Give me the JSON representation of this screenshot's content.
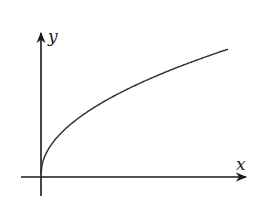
{
  "chart_data": {
    "type": "line",
    "title": "",
    "xlabel": "x",
    "ylabel": "y",
    "grid": false,
    "legend": null,
    "function_shape": "y = sqrt(x)",
    "x": [
      0,
      0.02,
      0.1,
      0.25,
      0.5,
      0.75,
      1.0
    ],
    "series": [
      {
        "name": "curve",
        "values": [
          0.02,
          0.16,
          0.33,
          0.5,
          0.71,
          0.87,
          1.0
        ]
      }
    ],
    "xlim": [
      0,
      1.1
    ],
    "ylim": [
      0,
      1.1
    ],
    "ticks": []
  },
  "labels": {
    "x_axis": "x",
    "y_axis": "y"
  },
  "colors": {
    "axis": "#1a1a1a",
    "curve": "#333333",
    "background": "#ffffff"
  }
}
